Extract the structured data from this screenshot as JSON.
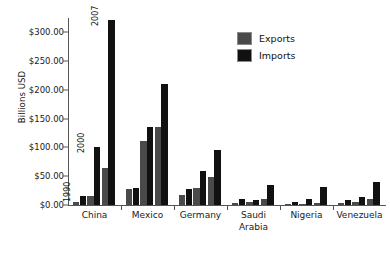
{
  "chart_data": {
    "type": "bar",
    "title": "",
    "xlabel": "",
    "ylabel": "Billions USD",
    "ylim": [
      0,
      325
    ],
    "yticks": [
      "$0.00",
      "$50.00",
      "$100.00",
      "$150.00",
      "$200.00",
      "$250.00",
      "$300.00"
    ],
    "ytick_values": [
      0,
      50,
      100,
      150,
      200,
      250,
      300
    ],
    "grid": false,
    "legend_position": "top-right",
    "legend": [
      "Exports",
      "Imports"
    ],
    "categories": [
      "China",
      "Mexico",
      "Germany",
      "Saudi\nArabia",
      "Nigeria",
      "Venezuela"
    ],
    "subgroups": [
      "1990",
      "2000",
      "2007"
    ],
    "annotations": [
      "1990",
      "2000",
      "2007"
    ],
    "series": [
      {
        "name": "Exports",
        "color": "#4a4a4a",
        "values": [
          [
            5,
            16,
            65
          ],
          [
            28,
            111,
            136
          ],
          [
            18,
            29,
            49
          ],
          [
            4,
            5,
            10
          ],
          [
            1,
            1,
            3
          ],
          [
            3,
            5,
            10
          ]
        ]
      },
      {
        "name": "Imports",
        "color": "#111111",
        "values": [
          [
            15,
            100,
            322
          ],
          [
            30,
            136,
            211
          ],
          [
            28,
            59,
            95
          ],
          [
            10,
            9,
            35
          ],
          [
            5,
            10,
            32
          ],
          [
            9,
            14,
            40
          ]
        ]
      }
    ]
  },
  "legend": {
    "exports_label": "Exports",
    "imports_label": "Imports"
  },
  "axis": {
    "y_title": "Billions USD"
  }
}
